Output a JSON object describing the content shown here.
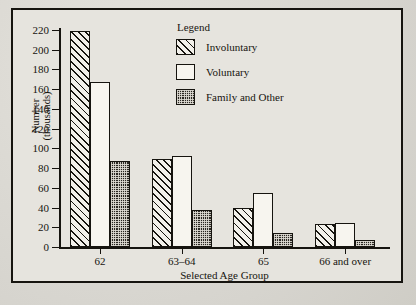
{
  "chart_data": {
    "type": "bar",
    "title": "",
    "xlabel": "Selected Age Group",
    "ylabel": "Number\n(thousands)",
    "ylabel_line1": "Number",
    "ylabel_line2": "(thousands)",
    "categories": [
      "62",
      "63–64",
      "65",
      "66 and over"
    ],
    "series": [
      {
        "name": "Involuntary",
        "values": [
          219,
          89,
          40,
          23
        ],
        "pattern": "diagonal-hatch"
      },
      {
        "name": "Voluntary",
        "values": [
          167,
          92,
          55,
          24
        ],
        "pattern": "open-white"
      },
      {
        "name": "Family and Other",
        "values": [
          87,
          38,
          14,
          7
        ],
        "pattern": "dark-checker"
      }
    ],
    "ylim": [
      0,
      220
    ],
    "yticks": [
      0,
      20,
      40,
      60,
      80,
      100,
      120,
      140,
      160,
      180,
      200,
      220
    ],
    "ytick_labels": [
      "0",
      "20",
      "40",
      "60",
      "80",
      "100",
      "120",
      "140",
      "160",
      "180",
      "200",
      "220"
    ],
    "grid": false,
    "legend_position": "top-center",
    "legend_title": "Legend"
  },
  "legend": {
    "title": "Legend",
    "entries": [
      {
        "label": "Involuntary"
      },
      {
        "label": "Voluntary"
      },
      {
        "label": "Family and Other"
      }
    ]
  },
  "colors": {
    "ink": "#16140f",
    "paper": "#e6e4de",
    "page": "#d8d6d0",
    "bar_open": "#f7f5ef",
    "bar_dark": "#2a2722"
  }
}
